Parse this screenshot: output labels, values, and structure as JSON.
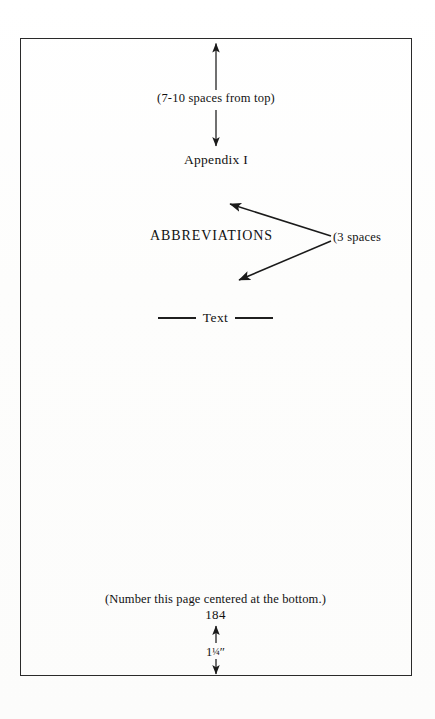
{
  "page": {
    "kind": "manuscript-layout-diagram",
    "background_color": "#fefefe",
    "frame_color": "#2a2a2a",
    "ink_color": "#111111"
  },
  "annotations": {
    "top_spacing_note": "(7-10 spaces from top)",
    "appendix_heading": "Appendix I",
    "section_heading": "ABBREVIATIONS",
    "three_spaces_note": "(3 spaces",
    "text_word": "Text",
    "number_page_note": "(Number this page centered at the bottom.)",
    "page_number": "184",
    "bottom_margin_whole": "1",
    "bottom_margin_fraction": "¼",
    "bottom_margin_unit": "″",
    "bottom_margin_full": "1¼″"
  },
  "arrows": [
    {
      "name": "arrow-top-up",
      "direction": "up",
      "from": [
        216,
        90
      ],
      "to": [
        216,
        41
      ],
      "head_at": "to"
    },
    {
      "name": "arrow-to-appendix-down",
      "direction": "down",
      "from": [
        216,
        110
      ],
      "to": [
        216,
        148
      ],
      "head_at": "to"
    },
    {
      "name": "arrow-three-spaces-upper",
      "direction": "up-left",
      "from": [
        331,
        236
      ],
      "to": [
        228,
        203
      ],
      "head_at": "to"
    },
    {
      "name": "arrow-three-spaces-lower",
      "direction": "down-left",
      "from": [
        331,
        241
      ],
      "to": [
        237,
        281
      ],
      "head_at": "to"
    },
    {
      "name": "arrow-bottom-margin-up",
      "direction": "up",
      "from": [
        216,
        644
      ],
      "to": [
        216,
        625
      ],
      "head_at": "to"
    },
    {
      "name": "arrow-bottom-margin-down",
      "direction": "down",
      "from": [
        216,
        660
      ],
      "to": [
        216,
        676
      ],
      "head_at": "to"
    }
  ],
  "frame": {
    "left": 20,
    "top": 38,
    "width": 392,
    "height": 638
  }
}
